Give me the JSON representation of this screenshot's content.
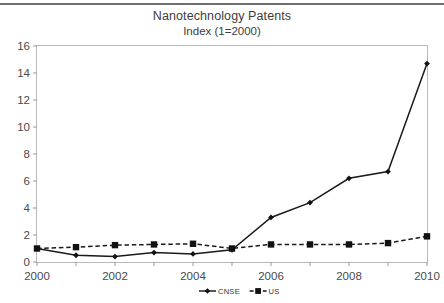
{
  "figure": {
    "title": "Nanotechnology Patents",
    "subtitle": "Index (1=2000)",
    "top_rule_color": "#6e6e6e",
    "background_color": "#ffffff"
  },
  "chart_data": {
    "type": "line",
    "title": "Nanotechnology Patents",
    "subtitle": "Index (1=2000)",
    "xlabel": "",
    "ylabel": "",
    "x": [
      2000,
      2001,
      2002,
      2003,
      2004,
      2005,
      2006,
      2007,
      2008,
      2009,
      2010
    ],
    "xlim": [
      2000,
      2010
    ],
    "ylim": [
      0,
      16
    ],
    "yticks": [
      0,
      2,
      4,
      6,
      8,
      10,
      12,
      14,
      16
    ],
    "xticks": [
      2000,
      2001,
      2002,
      2003,
      2004,
      2005,
      2006,
      2007,
      2008,
      2009,
      2010
    ],
    "xtick_labels": [
      "2000",
      "",
      "2002",
      "",
      "2004",
      "",
      "2006",
      "",
      "2008",
      "",
      "2010"
    ],
    "ytick_labels": [
      "0",
      "2",
      "4",
      "6",
      "8",
      "10",
      "12",
      "14",
      "16"
    ],
    "grid": false,
    "legend_position": "bottom-center",
    "series": [
      {
        "name": "CNSE",
        "marker": "diamond",
        "linestyle": "solid",
        "color": "#111111",
        "values": [
          1.0,
          0.5,
          0.4,
          0.7,
          0.6,
          0.9,
          3.3,
          4.4,
          6.2,
          6.7,
          14.7
        ]
      },
      {
        "name": "US",
        "marker": "square",
        "linestyle": "dashed",
        "color": "#111111",
        "values": [
          1.0,
          1.1,
          1.25,
          1.3,
          1.35,
          1.0,
          1.3,
          1.3,
          1.3,
          1.4,
          1.9
        ]
      }
    ]
  },
  "legend": {
    "entries": [
      {
        "label": "CNSE",
        "marker": "diamond",
        "linestyle": "solid"
      },
      {
        "label": "US",
        "marker": "square",
        "linestyle": "dashed"
      }
    ]
  }
}
